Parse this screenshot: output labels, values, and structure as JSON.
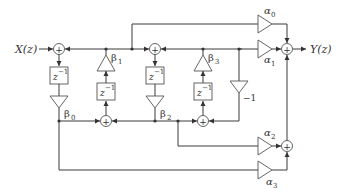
{
  "diagram": {
    "type": "signal-flow block diagram",
    "input_label": "X(z)",
    "output_label": "Y(z)",
    "delay_label": "z",
    "delay_exp": "−1",
    "sum_symbol": "+",
    "gains": {
      "beta0": {
        "sym": "β",
        "sub": "0"
      },
      "beta1": {
        "sym": "β",
        "sub": "1"
      },
      "beta2": {
        "sym": "β",
        "sub": "2"
      },
      "beta3": {
        "sym": "β",
        "sub": "3"
      },
      "alpha0": {
        "sym": "α",
        "sub": "0"
      },
      "alpha1": {
        "sym": "α",
        "sub": "1"
      },
      "alpha2": {
        "sym": "α",
        "sub": "2"
      },
      "alpha3": {
        "sym": "α",
        "sub": "3"
      },
      "neg_one": "−1"
    }
  }
}
